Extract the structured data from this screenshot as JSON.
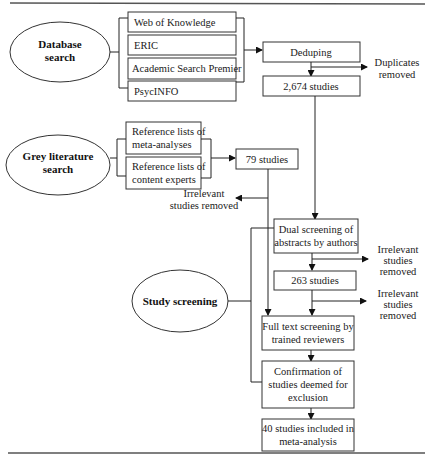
{
  "diagram": {
    "type": "flowchart",
    "phases": [
      {
        "id": "database_search",
        "label_line1": "Database",
        "label_line2": "search"
      },
      {
        "id": "grey_literature",
        "label_line1": "Grey literature",
        "label_line2": "search"
      },
      {
        "id": "study_screening",
        "label_line1": "Study screening"
      }
    ],
    "databases": [
      {
        "label": "Web of Knowledge"
      },
      {
        "label": "ERIC"
      },
      {
        "label": "Academic Search Premier"
      },
      {
        "label": "PsycINFO"
      }
    ],
    "grey_sources": [
      {
        "line1": "Reference lists of",
        "line2": "meta-analyses"
      },
      {
        "line1": "Reference lists of",
        "line2": "content experts"
      }
    ],
    "process": {
      "deduping": "Deduping",
      "duplicates_removed": {
        "line1": "Duplicates",
        "line2": "removed"
      },
      "db_count": "2,674 studies",
      "grey_count": "79 studies",
      "grey_irrelevant": {
        "line1": "Irrelevant",
        "line2": "studies removed"
      },
      "dual_screening": {
        "line1": "Dual screening of",
        "line2": "abstracts by authors"
      },
      "irrelevant_1": {
        "line1": "Irrelevant",
        "line2": "studies",
        "line3": "removed"
      },
      "after_abstract": "263 studies",
      "irrelevant_2": {
        "line1": "Irrelevant",
        "line2": "studies",
        "line3": "removed"
      },
      "full_text": {
        "line1": "Full text screening by",
        "line2": "trained reviewers"
      },
      "confirmation": {
        "line1": "Confirmation of",
        "line2": "studies deemed for",
        "line3": "exclusion"
      },
      "final": {
        "line1": "40 studies included in",
        "line2": "meta-analysis"
      }
    }
  }
}
